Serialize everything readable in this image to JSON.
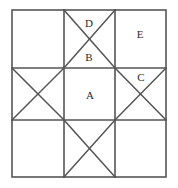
{
  "figure": {
    "type": "geometric-diagram",
    "background_color": "#ffffff",
    "stroke_color": "#555555",
    "label_color": "#2a2a2a",
    "outer_square": {
      "x": 12,
      "y": 10,
      "width": 154,
      "height": 167
    },
    "grid": {
      "columns": 3,
      "rows": 3,
      "vertical_lines_x": [
        64,
        115
      ],
      "horizontal_lines_y": [
        68,
        120
      ]
    },
    "cells": [
      {
        "id": "top-left",
        "row": 0,
        "col": 0,
        "diagonals": "none",
        "label": ""
      },
      {
        "id": "top-middle",
        "row": 0,
        "col": 1,
        "diagonals": "both",
        "label": ""
      },
      {
        "id": "top-right",
        "row": 0,
        "col": 2,
        "diagonals": "none",
        "label": "E"
      },
      {
        "id": "middle-left",
        "row": 1,
        "col": 0,
        "diagonals": "both",
        "label": ""
      },
      {
        "id": "center",
        "row": 1,
        "col": 1,
        "diagonals": "none",
        "label": "A"
      },
      {
        "id": "middle-right",
        "row": 1,
        "col": 2,
        "diagonals": "both",
        "label": "C"
      },
      {
        "id": "bottom-left",
        "row": 2,
        "col": 0,
        "diagonals": "none",
        "label": ""
      },
      {
        "id": "bottom-middle",
        "row": 2,
        "col": 1,
        "diagonals": "both",
        "label": ""
      },
      {
        "id": "bottom-right",
        "row": 2,
        "col": 2,
        "diagonals": "none",
        "label": ""
      }
    ],
    "labels": [
      {
        "id": "label-d",
        "text": "D",
        "x": 89,
        "y": 23,
        "region": "top-middle-upper-triangle"
      },
      {
        "id": "label-b",
        "text": "B",
        "x": 89,
        "y": 57,
        "region": "top-middle-lower-triangle"
      },
      {
        "id": "label-e",
        "text": "E",
        "x": 140,
        "y": 34,
        "region": "top-right-cell"
      },
      {
        "id": "label-c",
        "text": "C",
        "x": 141,
        "y": 77,
        "region": "middle-right-upper-triangle"
      },
      {
        "id": "label-a",
        "text": "A",
        "x": 90,
        "y": 95,
        "region": "center-cell"
      }
    ]
  }
}
